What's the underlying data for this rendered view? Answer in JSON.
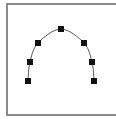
{
  "canvas": {
    "background": "#ffffff",
    "border_color": "#8a8a8a"
  },
  "curve": {
    "type": "arc",
    "stroke": "#555555",
    "stroke_width": 1,
    "points": [
      {
        "x": 28,
        "y": 81
      },
      {
        "x": 30,
        "y": 62
      },
      {
        "x": 38,
        "y": 43
      },
      {
        "x": 61,
        "y": 29
      },
      {
        "x": 84,
        "y": 43
      },
      {
        "x": 92,
        "y": 62
      },
      {
        "x": 94,
        "y": 81
      }
    ]
  },
  "control_points": {
    "shape": "square",
    "size": 6,
    "fill": "#111111",
    "count": 7
  }
}
